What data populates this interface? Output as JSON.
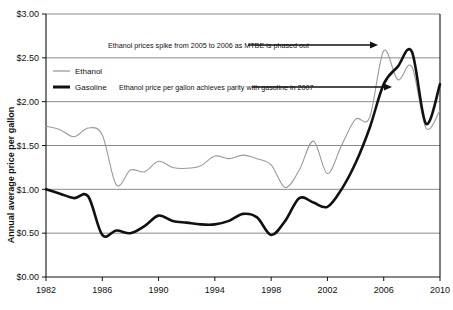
{
  "chart_data": {
    "type": "line",
    "title": "",
    "xlabel": "",
    "ylabel": "Annual average price per gallon",
    "xlim": [
      1982,
      2010
    ],
    "ylim": [
      0,
      3
    ],
    "ytick_labels": [
      "$3.00",
      "$2.50",
      "$2.00",
      "$1.50",
      "$1.00",
      "$0.50",
      "$0.00"
    ],
    "ytick_values": [
      3.0,
      2.5,
      2.0,
      1.5,
      1.0,
      0.5,
      0.0
    ],
    "xtick_labels": [
      "1982",
      "1986",
      "1990",
      "1994",
      "1998",
      "2002",
      "2006",
      "2010"
    ],
    "xtick_values": [
      1982,
      1986,
      1990,
      1994,
      1998,
      2002,
      2006,
      2010
    ],
    "grid": true,
    "legend_position": "upper-left-inside",
    "x": [
      1982,
      1983,
      1984,
      1985,
      1986,
      1987,
      1988,
      1989,
      1990,
      1991,
      1992,
      1993,
      1994,
      1995,
      1996,
      1997,
      1998,
      1999,
      2000,
      2001,
      2002,
      2003,
      2004,
      2005,
      2006,
      2007,
      2008,
      2009,
      2010
    ],
    "series": [
      {
        "name": "Ethanol",
        "color": "#9a9a9a",
        "width": 1.1,
        "values": [
          1.72,
          1.68,
          1.6,
          1.7,
          1.62,
          1.05,
          1.22,
          1.2,
          1.32,
          1.25,
          1.24,
          1.27,
          1.38,
          1.35,
          1.39,
          1.35,
          1.28,
          1.02,
          1.22,
          1.55,
          1.18,
          1.5,
          1.8,
          1.82,
          2.58,
          2.25,
          2.4,
          1.7,
          1.9
        ]
      },
      {
        "name": "Gasoline",
        "color": "#111111",
        "width": 2.6,
        "values": [
          1.0,
          0.95,
          0.9,
          0.92,
          0.48,
          0.53,
          0.5,
          0.58,
          0.7,
          0.64,
          0.62,
          0.6,
          0.6,
          0.64,
          0.72,
          0.68,
          0.48,
          0.64,
          0.9,
          0.85,
          0.8,
          1.0,
          1.3,
          1.7,
          2.2,
          2.4,
          2.57,
          1.75,
          2.2
        ]
      }
    ],
    "annotations": [
      {
        "text": "Ethanol prices spike from 2005 to 2006 as MTBE is phased out",
        "text_x": 108,
        "text_y": 48,
        "arrow_from_x": 248,
        "arrow_from_y": 45,
        "arrow_to_x": 378,
        "arrow_to_y": 45
      },
      {
        "text": "Ethanol price per gallon achieves parity with gasoline in 2007",
        "text_x": 119,
        "text_y": 90,
        "arrow_from_x": 252,
        "arrow_from_y": 87,
        "arrow_to_x": 392,
        "arrow_to_y": 87
      }
    ],
    "legend": [
      {
        "label": "Ethanol",
        "color": "#9a9a9a",
        "width": 1.3
      },
      {
        "label": "Gasoline",
        "color": "#111111",
        "width": 3.0
      }
    ]
  }
}
